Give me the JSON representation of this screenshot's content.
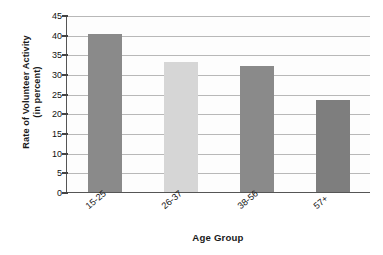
{
  "chart_data": {
    "type": "bar",
    "title": "",
    "categories": [
      "15-25",
      "26-37",
      "38-56",
      "57+"
    ],
    "values": [
      40.3,
      33.0,
      32.0,
      23.3
    ],
    "series": [
      {
        "name": "Rate of Volunteer Activity",
        "values": [
          40.3,
          33.0,
          32.0,
          23.3
        ]
      }
    ],
    "xlabel": "Age Group",
    "ylabel": "Rate of Volunteer Activity (in percent)",
    "ylabel_line1": "Rate of Volunteer Activity",
    "ylabel_line2": "(in percent)",
    "ylim": [
      0,
      45
    ],
    "ytick_labels": [
      "45",
      "40",
      "35",
      "30",
      "25",
      "20",
      "15",
      "10",
      "5",
      "0"
    ],
    "ytick_values": [
      45,
      40,
      35,
      30,
      25,
      20,
      15,
      10,
      5,
      0
    ],
    "ytick_step": 5,
    "grid": "horizontal",
    "legend": "none",
    "bar_colors": [
      "#8a8a8a",
      "#d6d6d6",
      "#8a8a8a",
      "#7e7e7e"
    ],
    "gridline_color": "#b8b8b8",
    "axis_color": "#555555",
    "background_color": "#fdfdfd"
  }
}
